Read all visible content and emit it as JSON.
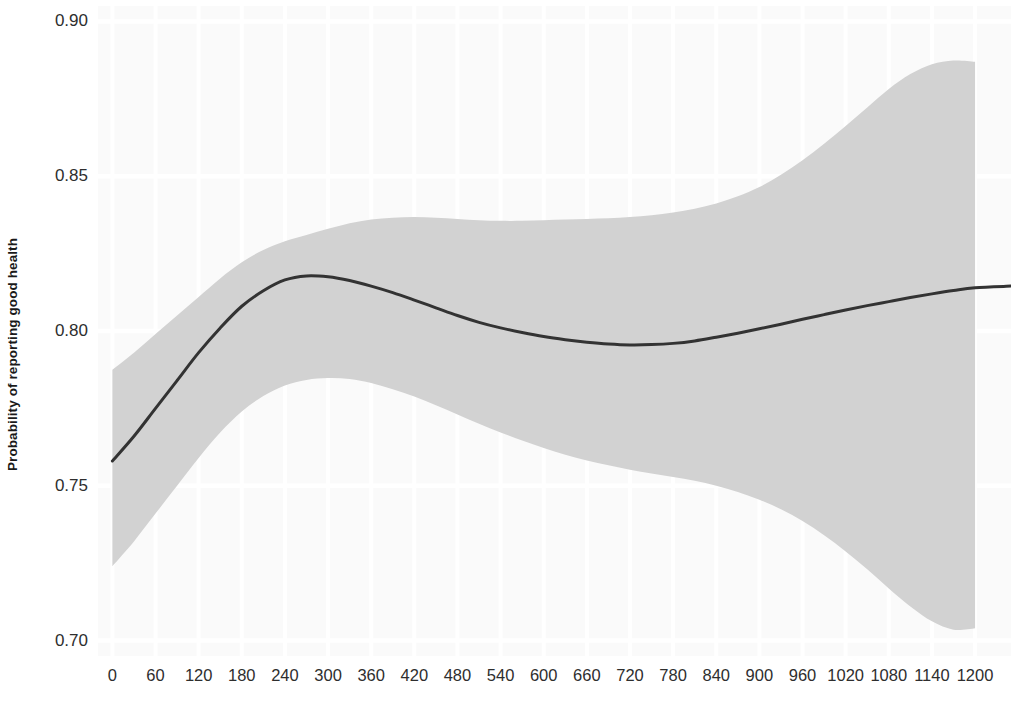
{
  "chart_data": {
    "type": "line",
    "title": "",
    "subtitle": "",
    "xlabel": "",
    "ylabel": "Probability of reporting good health",
    "xlim": [
      -20,
      1250
    ],
    "ylim": [
      0.695,
      0.905
    ],
    "grid": true,
    "legend": null,
    "x_ticks": [
      0,
      60,
      120,
      180,
      240,
      300,
      360,
      420,
      480,
      540,
      600,
      660,
      720,
      780,
      840,
      900,
      960,
      1020,
      1080,
      1140,
      1200
    ],
    "x_tick_labels": [
      "0",
      "60",
      "120",
      "180",
      "240",
      "300",
      "360",
      "420",
      "480",
      "540",
      "600",
      "660",
      "720",
      "780",
      "840",
      "900",
      "960",
      "1020",
      "1080",
      "1140",
      "1200"
    ],
    "y_ticks": [
      0.7,
      0.75,
      0.8,
      0.85,
      0.9
    ],
    "y_tick_labels": [
      "0.70",
      "0.75",
      "0.80",
      "0.85",
      "0.90"
    ],
    "series": [
      {
        "name": "fitted",
        "kind": "line",
        "color": "#333333",
        "linewidth": 3,
        "x": [
          0,
          30,
          60,
          90,
          120,
          150,
          180,
          210,
          240,
          270,
          300,
          330,
          360,
          390,
          420,
          450,
          480,
          510,
          540,
          570,
          600,
          630,
          660,
          690,
          720,
          750,
          780,
          810,
          840,
          870,
          900,
          930,
          960,
          990,
          1020,
          1050,
          1080,
          1110,
          1140,
          1170,
          1200,
          1250
        ],
        "y": [
          0.758,
          0.766,
          0.775,
          0.784,
          0.793,
          0.801,
          0.808,
          0.813,
          0.8165,
          0.8178,
          0.8175,
          0.8163,
          0.8145,
          0.8124,
          0.81,
          0.8075,
          0.805,
          0.8028,
          0.801,
          0.7995,
          0.7982,
          0.7972,
          0.7964,
          0.7958,
          0.7955,
          0.7956,
          0.796,
          0.7968,
          0.798,
          0.7993,
          0.8007,
          0.8022,
          0.8038,
          0.8053,
          0.8068,
          0.8082,
          0.8095,
          0.8108,
          0.812,
          0.8131,
          0.814,
          0.8145
        ]
      }
    ],
    "confidence_band": {
      "name": "95% confidence interval",
      "color": "#d2d2d2",
      "opacity": 1,
      "x": [
        0,
        30,
        60,
        90,
        120,
        150,
        180,
        210,
        240,
        270,
        300,
        330,
        360,
        390,
        420,
        450,
        480,
        510,
        540,
        570,
        600,
        630,
        660,
        690,
        720,
        750,
        780,
        810,
        840,
        870,
        900,
        930,
        960,
        990,
        1020,
        1050,
        1080,
        1110,
        1140,
        1170,
        1200
      ],
      "upper": [
        0.7875,
        0.793,
        0.799,
        0.805,
        0.811,
        0.817,
        0.8222,
        0.8262,
        0.829,
        0.831,
        0.833,
        0.8348,
        0.836,
        0.8366,
        0.8368,
        0.8366,
        0.8362,
        0.8358,
        0.8356,
        0.8356,
        0.8358,
        0.836,
        0.8362,
        0.8364,
        0.8368,
        0.8374,
        0.8383,
        0.8395,
        0.8412,
        0.8435,
        0.8465,
        0.8505,
        0.8552,
        0.8605,
        0.8662,
        0.8722,
        0.8782,
        0.883,
        0.8862,
        0.8874,
        0.887
      ],
      "lower": [
        0.724,
        0.732,
        0.741,
        0.75,
        0.759,
        0.7672,
        0.774,
        0.779,
        0.7824,
        0.7842,
        0.7848,
        0.7845,
        0.7832,
        0.7812,
        0.7788,
        0.776,
        0.773,
        0.77,
        0.7672,
        0.7646,
        0.7622,
        0.76,
        0.7582,
        0.7566,
        0.7552,
        0.754,
        0.7528,
        0.7516,
        0.75,
        0.748,
        0.7455,
        0.7424,
        0.7386,
        0.734,
        0.7288,
        0.723,
        0.7168,
        0.711,
        0.7062,
        0.7035,
        0.704
      ]
    },
    "panel": {
      "background_color": "#fafafa",
      "grid_color": "#ffffff",
      "minor_grid_color": "#fdfdfd"
    }
  }
}
